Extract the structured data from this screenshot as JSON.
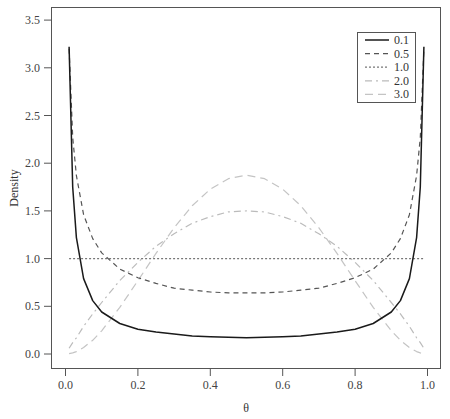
{
  "chart_data": {
    "type": "line",
    "title": "",
    "xlabel": "θ",
    "ylabel": "Density",
    "xlim": [
      -0.03,
      1.03
    ],
    "ylim": [
      -0.15,
      3.65
    ],
    "xticks": [
      0.0,
      0.2,
      0.4,
      0.6,
      0.8,
      1.0
    ],
    "xtick_labels": [
      "0.0",
      "0.2",
      "0.4",
      "0.6",
      "0.8",
      "1.0"
    ],
    "yticks": [
      0.0,
      0.5,
      1.0,
      1.5,
      2.0,
      2.5,
      3.0,
      3.5
    ],
    "ytick_labels": [
      "0.0",
      "0.5",
      "1.0",
      "1.5",
      "2.0",
      "2.5",
      "3.0",
      "3.5"
    ],
    "grid": false,
    "legend_position": "top-right",
    "x": [
      0.01,
      0.02,
      0.03,
      0.05,
      0.075,
      0.1,
      0.15,
      0.2,
      0.25,
      0.3,
      0.35,
      0.4,
      0.45,
      0.5,
      0.55,
      0.6,
      0.65,
      0.7,
      0.75,
      0.8,
      0.85,
      0.9,
      0.925,
      0.95,
      0.97,
      0.98,
      0.99
    ],
    "series": [
      {
        "name": "0.1",
        "color": "#1a1a1a",
        "dash": "",
        "width": 1.5,
        "values": [
          3.22,
          1.75,
          1.22,
          0.79,
          0.56,
          0.44,
          0.32,
          0.26,
          0.23,
          0.21,
          0.19,
          0.18,
          0.175,
          0.17,
          0.175,
          0.18,
          0.19,
          0.21,
          0.23,
          0.26,
          0.32,
          0.44,
          0.56,
          0.79,
          1.22,
          1.75,
          3.22
        ]
      },
      {
        "name": "0.5",
        "color": "#555555",
        "dash": "5,4",
        "width": 1.2,
        "values": [
          3.2,
          2.27,
          1.87,
          1.46,
          1.21,
          1.06,
          0.89,
          0.8,
          0.74,
          0.69,
          0.67,
          0.65,
          0.64,
          0.64,
          0.64,
          0.65,
          0.67,
          0.69,
          0.74,
          0.8,
          0.89,
          1.06,
          1.21,
          1.46,
          1.87,
          2.27,
          3.2
        ]
      },
      {
        "name": "1.0",
        "color": "#777777",
        "dash": "2,2",
        "width": 1.2,
        "values": [
          1,
          1,
          1,
          1,
          1,
          1,
          1,
          1,
          1,
          1,
          1,
          1,
          1,
          1,
          1,
          1,
          1,
          1,
          1,
          1,
          1,
          1,
          1,
          1,
          1,
          1,
          1
        ]
      },
      {
        "name": "2.0",
        "color": "#bbbbbb",
        "dash": "7,4,2,4",
        "width": 1.2,
        "values": [
          0.06,
          0.12,
          0.17,
          0.29,
          0.42,
          0.54,
          0.77,
          0.96,
          1.13,
          1.26,
          1.37,
          1.44,
          1.49,
          1.5,
          1.49,
          1.44,
          1.37,
          1.26,
          1.13,
          0.96,
          0.77,
          0.54,
          0.42,
          0.29,
          0.17,
          0.12,
          0.06
        ]
      },
      {
        "name": "3.0",
        "color": "#c4c4c4",
        "dash": "8,5",
        "width": 1.2,
        "values": [
          0.003,
          0.012,
          0.025,
          0.068,
          0.144,
          0.243,
          0.488,
          0.768,
          1.055,
          1.323,
          1.553,
          1.728,
          1.838,
          1.875,
          1.838,
          1.728,
          1.553,
          1.323,
          1.055,
          0.768,
          0.488,
          0.243,
          0.144,
          0.068,
          0.025,
          0.012,
          0.003
        ]
      }
    ]
  }
}
